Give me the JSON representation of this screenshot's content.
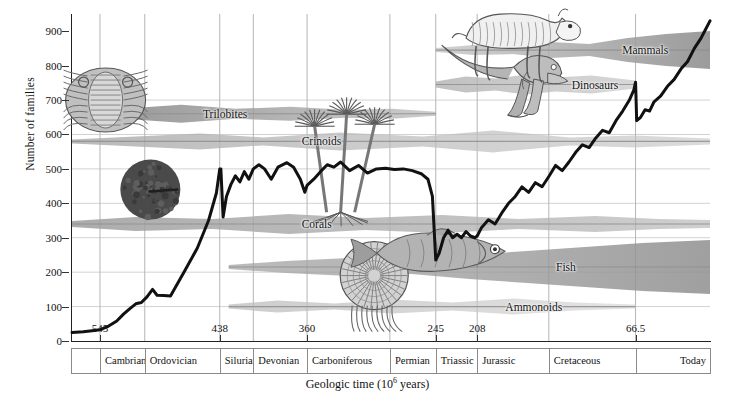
{
  "chart_data": {
    "type": "line",
    "title": "",
    "xlabel": "Geologic time (10⁶ years)",
    "ylabel": "Number of families",
    "ylim": [
      0,
      950
    ],
    "yticks": [
      0,
      100,
      200,
      300,
      400,
      500,
      600,
      700,
      800,
      900
    ],
    "xlim_mya": [
      570,
      0
    ],
    "xticks_mya": [
      545,
      438,
      360,
      245,
      208,
      66.5
    ],
    "xtick_labels": [
      "545",
      "438",
      "360",
      "245",
      "208",
      "66.5"
    ],
    "grid": "both-light",
    "legend": "inline-labels",
    "series": [
      {
        "name": "Number of marine animal families",
        "color": "#111111",
        "points_mya_value": [
          [
            570,
            25
          ],
          [
            560,
            27
          ],
          [
            552,
            30
          ],
          [
            545,
            33
          ],
          [
            538,
            42
          ],
          [
            530,
            58
          ],
          [
            524,
            78
          ],
          [
            518,
            95
          ],
          [
            513,
            108
          ],
          [
            508,
            112
          ],
          [
            503,
            128
          ],
          [
            498,
            150
          ],
          [
            494,
            133
          ],
          [
            488,
            132
          ],
          [
            482,
            131
          ],
          [
            470,
            200
          ],
          [
            458,
            270
          ],
          [
            448,
            350
          ],
          [
            441,
            430
          ],
          [
            438,
            500
          ],
          [
            437,
            500
          ],
          [
            435,
            360
          ],
          [
            432,
            420
          ],
          [
            428,
            455
          ],
          [
            424,
            480
          ],
          [
            420,
            462
          ],
          [
            416,
            492
          ],
          [
            412,
            470
          ],
          [
            408,
            500
          ],
          [
            403,
            512
          ],
          [
            398,
            500
          ],
          [
            392,
            470
          ],
          [
            386,
            505
          ],
          [
            378,
            518
          ],
          [
            372,
            505
          ],
          [
            366,
            470
          ],
          [
            362,
            432
          ],
          [
            360,
            452
          ],
          [
            354,
            470
          ],
          [
            348,
            492
          ],
          [
            342,
            512
          ],
          [
            336,
            505
          ],
          [
            330,
            520
          ],
          [
            322,
            495
          ],
          [
            314,
            510
          ],
          [
            306,
            488
          ],
          [
            298,
            500
          ],
          [
            290,
            502
          ],
          [
            282,
            498
          ],
          [
            274,
            500
          ],
          [
            266,
            495
          ],
          [
            258,
            486
          ],
          [
            252,
            470
          ],
          [
            248,
            420
          ],
          [
            245,
            235
          ],
          [
            242,
            255
          ],
          [
            238,
            300
          ],
          [
            234,
            322
          ],
          [
            230,
            300
          ],
          [
            226,
            310
          ],
          [
            222,
            300
          ],
          [
            218,
            318
          ],
          [
            214,
            305
          ],
          [
            210,
            300
          ],
          [
            208,
            305
          ],
          [
            204,
            330
          ],
          [
            198,
            352
          ],
          [
            192,
            340
          ],
          [
            186,
            372
          ],
          [
            180,
            400
          ],
          [
            174,
            420
          ],
          [
            168,
            448
          ],
          [
            162,
            432
          ],
          [
            156,
            460
          ],
          [
            150,
            448
          ],
          [
            144,
            478
          ],
          [
            138,
            510
          ],
          [
            132,
            495
          ],
          [
            126,
            520
          ],
          [
            120,
            548
          ],
          [
            114,
            570
          ],
          [
            108,
            562
          ],
          [
            102,
            590
          ],
          [
            96,
            612
          ],
          [
            90,
            605
          ],
          [
            84,
            640
          ],
          [
            78,
            668
          ],
          [
            72,
            700
          ],
          [
            68,
            730
          ],
          [
            66.5,
            752
          ],
          [
            65.5,
            640
          ],
          [
            62,
            650
          ],
          [
            58,
            672
          ],
          [
            54,
            668
          ],
          [
            50,
            695
          ],
          [
            44,
            712
          ],
          [
            38,
            740
          ],
          [
            32,
            760
          ],
          [
            26,
            790
          ],
          [
            20,
            812
          ],
          [
            14,
            850
          ],
          [
            8,
            880
          ],
          [
            4,
            905
          ],
          [
            0,
            930
          ]
        ]
      }
    ],
    "taxon_bands": [
      {
        "name": "Trilobites",
        "label": "Trilobites",
        "start_mya": 570,
        "end_mya": 245,
        "y_value": 660
      },
      {
        "name": "Crinoids",
        "label": "Crinoids",
        "start_mya": 570,
        "end_mya": 0,
        "y_value": 580
      },
      {
        "name": "Corals",
        "label": "Corals",
        "start_mya": 570,
        "end_mya": 0,
        "y_value": 340
      },
      {
        "name": "Ammonoids",
        "label": "Ammonoids",
        "start_mya": 430,
        "end_mya": 66.5,
        "y_value": 100
      },
      {
        "name": "Fish",
        "label": "Fish",
        "start_mya": 430,
        "end_mya": 0,
        "y_value": 215
      },
      {
        "name": "Dinosaurs",
        "label": "Dinosaurs",
        "start_mya": 245,
        "end_mya": 66.5,
        "y_value": 745
      },
      {
        "name": "Mammals",
        "label": "Mammals",
        "start_mya": 245,
        "end_mya": 0,
        "y_value": 845
      }
    ],
    "illustrations": [
      {
        "name": "trilobite",
        "label": "Trilobite"
      },
      {
        "name": "crinoid",
        "label": "Crinoid"
      },
      {
        "name": "coral-colony",
        "label": "Coral colony"
      },
      {
        "name": "ammonoid",
        "label": "Ammonoid"
      },
      {
        "name": "fish",
        "label": "Fish"
      },
      {
        "name": "dinosaur",
        "label": "Dinosaur"
      },
      {
        "name": "mammal",
        "label": "Mammal"
      }
    ]
  },
  "axes": {
    "y_title": "Number of families",
    "y_ticks": [
      "0",
      "100",
      "200",
      "300",
      "400",
      "500",
      "600",
      "700",
      "800",
      "900"
    ],
    "x_title_text": "Geologic time (10",
    "x_title_sup": "6",
    "x_title_tail": " years)",
    "x_ticks": [
      {
        "label": "545",
        "mya": 545
      },
      {
        "label": "438",
        "mya": 438
      },
      {
        "label": "360",
        "mya": 360
      },
      {
        "label": "245",
        "mya": 245
      },
      {
        "label": "208",
        "mya": 208
      },
      {
        "label": "66.5",
        "mya": 66.5
      }
    ]
  },
  "periods": [
    {
      "label": "",
      "start_mya": 570,
      "end_mya": 545
    },
    {
      "label": "Cambrian",
      "start_mya": 545,
      "end_mya": 505
    },
    {
      "label": "Ordovician",
      "start_mya": 505,
      "end_mya": 438
    },
    {
      "label": "Silurian",
      "start_mya": 438,
      "end_mya": 408
    },
    {
      "label": "Devonian",
      "start_mya": 408,
      "end_mya": 360
    },
    {
      "label": "Carboniferous",
      "start_mya": 360,
      "end_mya": 286
    },
    {
      "label": "Permian",
      "start_mya": 286,
      "end_mya": 245
    },
    {
      "label": "Triassic",
      "start_mya": 245,
      "end_mya": 208
    },
    {
      "label": "Jurassic",
      "start_mya": 208,
      "end_mya": 144
    },
    {
      "label": "Cretaceous",
      "start_mya": 144,
      "end_mya": 66.5
    },
    {
      "label": "Today",
      "start_mya": 66.5,
      "end_mya": 0
    }
  ],
  "colors": {
    "curve": "#111111",
    "band_dark": "#8d8d8d",
    "band_mid": "#a8a8a8",
    "band_light": "#c9c9c9",
    "grid": "#bdbdbd",
    "axis": "#222222",
    "text": "#111111"
  }
}
